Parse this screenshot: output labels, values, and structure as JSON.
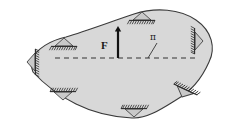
{
  "figure": {
    "name": "free-body-diagram",
    "background_color": "#ffffff",
    "body": {
      "name": "rigid-body",
      "fill_color": "#d8d8d8",
      "stroke_color": "#3a3a3a",
      "stroke_width": 1.1
    },
    "force_arrow": {
      "label": "F",
      "color": "#111111",
      "direction": "up",
      "x": 118,
      "y_tail": 58,
      "y_head": 26,
      "label_x": 101,
      "label_y": 40
    },
    "section_line": {
      "label": "π",
      "style": "dashed",
      "color": "#333333",
      "x_start": 55,
      "x_end": 196,
      "y": 58,
      "leader_from_x": 157,
      "leader_from_y": 44,
      "leader_to_x": 148,
      "leader_to_y": 58,
      "label_x": 150,
      "label_y": 33
    },
    "supports": [
      {
        "name": "support-left",
        "x": 27,
        "y": 62,
        "rotation": 270,
        "scale": 1.0
      },
      {
        "name": "support-upper-left",
        "x": 64,
        "y": 38,
        "rotation": 0,
        "scale": 1.0
      },
      {
        "name": "support-top",
        "x": 142,
        "y": 12,
        "rotation": 0,
        "scale": 1.0
      },
      {
        "name": "support-right",
        "x": 203,
        "y": 41,
        "rotation": 90,
        "scale": 1.0
      },
      {
        "name": "support-bottom-left",
        "x": 63,
        "y": 100,
        "rotation": 180,
        "scale": 1.0
      },
      {
        "name": "support-bottom-center",
        "x": 134,
        "y": 117,
        "rotation": 180,
        "scale": 1.0
      },
      {
        "name": "support-bottom-right",
        "x": 182,
        "y": 97,
        "rotation": 205,
        "scale": 1.0
      }
    ],
    "support_style": {
      "triangle_fill": "#c9c9c9",
      "triangle_stroke": "#444444",
      "ground_line_color": "#2b2b2b",
      "hatch_color": "#2b2b2b",
      "hatch_count": 11,
      "base_half_width": 9,
      "height": 8
    }
  }
}
